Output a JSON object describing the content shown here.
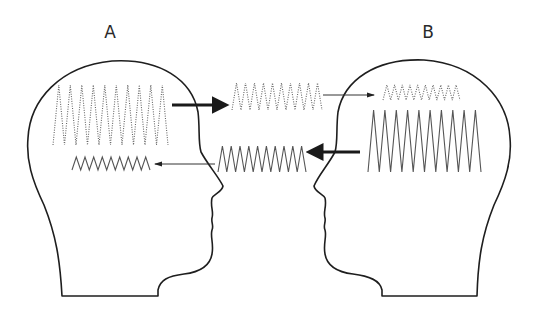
{
  "figure": {
    "type": "communication-diagram",
    "people": [
      {
        "id": "A",
        "label": "A",
        "label_pos": [
          110,
          32
        ],
        "facing": "right"
      },
      {
        "id": "B",
        "label": "B",
        "label_pos": [
          428,
          32
        ],
        "facing": "left"
      }
    ],
    "waveforms": [
      {
        "id": "a-large-dotted",
        "owner": "A",
        "style": "dotted",
        "peaks": 10,
        "x1": 53,
        "x2": 168,
        "y_top": 85,
        "y_bottom": 145
      },
      {
        "id": "a-small-solid",
        "owner": "A",
        "style": "solid",
        "peaks": 9,
        "x1": 72,
        "x2": 150,
        "y_top": 157,
        "y_bottom": 170
      },
      {
        "id": "mid-dotted",
        "owner": "transit",
        "style": "dotted",
        "peaks": 10,
        "x1": 232,
        "x2": 322,
        "y_top": 83,
        "y_bottom": 110
      },
      {
        "id": "mid-solid",
        "owner": "transit",
        "style": "solid",
        "peaks": 10,
        "x1": 218,
        "x2": 306,
        "y_top": 146,
        "y_bottom": 172
      },
      {
        "id": "b-small-dotted",
        "owner": "B",
        "style": "dotted",
        "peaks": 10,
        "x1": 383,
        "x2": 460,
        "y_top": 85,
        "y_bottom": 100
      },
      {
        "id": "b-large-solid",
        "owner": "B",
        "style": "solid",
        "peaks": 10,
        "x1": 368,
        "x2": 481,
        "y_top": 110,
        "y_bottom": 172
      }
    ],
    "arrows": [
      {
        "id": "a-to-mid",
        "weight": "thick",
        "x1": 172,
        "x2": 225,
        "y": 105,
        "direction": "right"
      },
      {
        "id": "mid-to-b",
        "weight": "thin",
        "x1": 323,
        "x2": 374,
        "y": 95,
        "direction": "right"
      },
      {
        "id": "b-to-mid",
        "weight": "thick",
        "x1": 360,
        "x2": 310,
        "y": 152,
        "direction": "left"
      },
      {
        "id": "mid-to-a",
        "weight": "thin",
        "x1": 215,
        "x2": 155,
        "y": 164,
        "direction": "left"
      }
    ]
  }
}
